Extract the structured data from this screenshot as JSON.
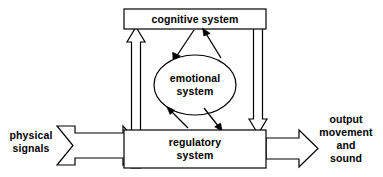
{
  "diagram": {
    "background_color": "#ffffff",
    "line_color": "#000000",
    "nodes": [
      {
        "id": "cognitive",
        "label": "cognitive system",
        "shape": "rectangle"
      },
      {
        "id": "emotional",
        "label_line1": "emotional",
        "label_line2": "system",
        "shape": "ellipse"
      },
      {
        "id": "regulatory",
        "label_line1": "regulatory",
        "label_line2": "system",
        "shape": "rectangle"
      }
    ],
    "input": {
      "label_line1": "physical",
      "label_line2": "signals",
      "arrow": "block-arrow-right"
    },
    "output": {
      "label_line1": "output",
      "label_line2": "movement",
      "label_line3": "and",
      "label_line4": "sound",
      "arrow": "block-arrow-right"
    },
    "connections": [
      {
        "id": "regulatory-to-cognitive",
        "from": "regulatory",
        "to": "cognitive",
        "style": "block-arrow-up"
      },
      {
        "id": "cognitive-to-regulatory",
        "from": "cognitive",
        "to": "regulatory",
        "style": "block-arrow-down"
      },
      {
        "id": "cognitive-to-emotional",
        "from": "cognitive",
        "to": "emotional",
        "style": "thin-arrow"
      },
      {
        "id": "emotional-to-cognitive",
        "from": "emotional",
        "to": "cognitive",
        "style": "thin-arrow"
      },
      {
        "id": "regulatory-to-emotional",
        "from": "regulatory",
        "to": "emotional",
        "style": "thin-arrow"
      },
      {
        "id": "emotional-to-regulatory",
        "from": "emotional",
        "to": "regulatory",
        "style": "thin-arrow"
      }
    ]
  }
}
